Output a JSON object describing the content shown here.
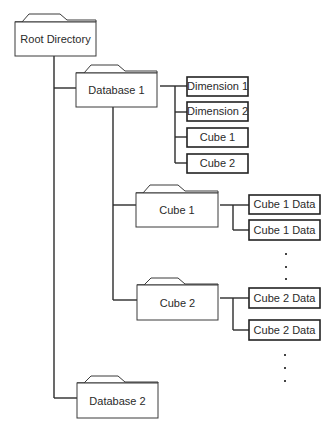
{
  "diagram": {
    "type": "directory-tree",
    "colors": {
      "line": "#2b2b2b",
      "box_fill": "#ffffff",
      "background": "#ffffff"
    },
    "nodes": [
      {
        "id": "root",
        "label": "Root Directory",
        "shape": "folder"
      },
      {
        "id": "db1",
        "label": "Database 1",
        "shape": "folder",
        "parent": "root"
      },
      {
        "id": "dim1",
        "label": "Dimension 1",
        "shape": "box",
        "parent": "db1"
      },
      {
        "id": "dim2",
        "label": "Dimension 2",
        "shape": "box",
        "parent": "db1"
      },
      {
        "id": "db1cube1",
        "label": "Cube 1",
        "shape": "box",
        "parent": "db1"
      },
      {
        "id": "db1cube2",
        "label": "Cube 2",
        "shape": "box",
        "parent": "db1"
      },
      {
        "id": "cube1",
        "label": "Cube 1",
        "shape": "folder",
        "parent": "db1"
      },
      {
        "id": "c1d1",
        "label": "Cube 1 Data",
        "shape": "box",
        "parent": "cube1"
      },
      {
        "id": "c1d2",
        "label": "Cube 1 Data",
        "shape": "box",
        "parent": "cube1"
      },
      {
        "id": "cube2",
        "label": "Cube 2",
        "shape": "folder",
        "parent": "db1"
      },
      {
        "id": "c2d1",
        "label": "Cube 2 Data",
        "shape": "box",
        "parent": "cube2"
      },
      {
        "id": "c2d2",
        "label": "Cube 2 Data",
        "shape": "box",
        "parent": "cube2"
      },
      {
        "id": "db2",
        "label": "Database 2",
        "shape": "folder",
        "parent": "root"
      }
    ],
    "labels": {
      "root": "Root Directory",
      "db1": "Database 1",
      "dim1": "Dimension 1",
      "dim2": "Dimension 2",
      "db1cube1": "Cube 1",
      "db1cube2": "Cube 2",
      "cube1": "Cube 1",
      "c1d1": "Cube 1 Data",
      "c1d2": "Cube 1 Data",
      "cube2": "Cube 2",
      "c2d1": "Cube 2 Data",
      "c2d2": "Cube 2 Data",
      "db2": "Database 2"
    },
    "ellipsis": "continuation-dots"
  }
}
